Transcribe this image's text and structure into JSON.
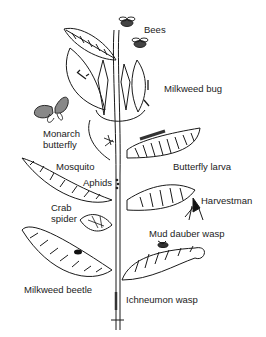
{
  "diagram": {
    "labels": [
      {
        "id": "bees",
        "text": "Bees",
        "x": 144,
        "y": 24
      },
      {
        "id": "milkweed-bug",
        "text": "Milkweed bug",
        "x": 164,
        "y": 83
      },
      {
        "id": "monarch-butterfly-1",
        "text": "Monarch",
        "x": 43,
        "y": 128
      },
      {
        "id": "monarch-butterfly-2",
        "text": "butterfly",
        "x": 43,
        "y": 139
      },
      {
        "id": "butterfly-larva",
        "text": "Butterfly larva",
        "x": 173,
        "y": 161
      },
      {
        "id": "mosquito",
        "text": "Mosquito",
        "x": 56,
        "y": 161
      },
      {
        "id": "aphids",
        "text": "Aphids",
        "x": 83,
        "y": 177
      },
      {
        "id": "harvestman",
        "text": "Harvestman",
        "x": 201,
        "y": 195
      },
      {
        "id": "crab-spider-1",
        "text": "Crab",
        "x": 51,
        "y": 202
      },
      {
        "id": "crab-spider-2",
        "text": "spider",
        "x": 51,
        "y": 213
      },
      {
        "id": "mud-dauber-wasp",
        "text": "Mud dauber wasp",
        "x": 149,
        "y": 228
      },
      {
        "id": "milkweed-beetle",
        "text": "Milkweed beetle",
        "x": 24,
        "y": 284
      },
      {
        "id": "ichneumon-wasp",
        "text": "Ichneumon wasp",
        "x": 126,
        "y": 294
      }
    ]
  }
}
